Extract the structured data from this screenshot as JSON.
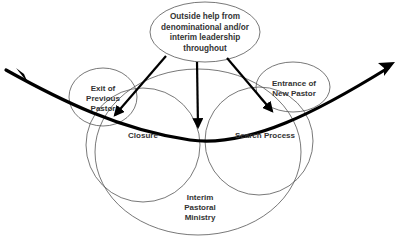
{
  "diagram": {
    "title": "",
    "nodes": {
      "outside_help": {
        "line1": "Outside help from",
        "line2": "denominational and/or",
        "line3": "interim leadership",
        "line4": "throughout"
      },
      "exit_previous_pastor": {
        "line1": "Exit of",
        "line2": "Previous",
        "line3": "Pastor"
      },
      "entrance_new_pastor": {
        "line1": "Entrance of",
        "line2": "New Pastor"
      },
      "closure": {
        "label": "Closure"
      },
      "search_process": {
        "label": "Search Process"
      },
      "interim_pastoral_ministry": {
        "line1": "Interim",
        "line2": "Pastoral",
        "line3": "Ministry"
      }
    },
    "edges": [
      {
        "from": "outside_help",
        "to": "closure"
      },
      {
        "from": "outside_help",
        "to": "interim_pastoral_ministry"
      },
      {
        "from": "outside_help",
        "to": "search_process"
      }
    ],
    "timeline": {
      "direction": "left-to-right",
      "style": "thick curved arrow"
    },
    "colors": {
      "stroke": "#000000",
      "thin_stroke": "#555555",
      "text": "#333333",
      "background": "#ffffff"
    }
  }
}
